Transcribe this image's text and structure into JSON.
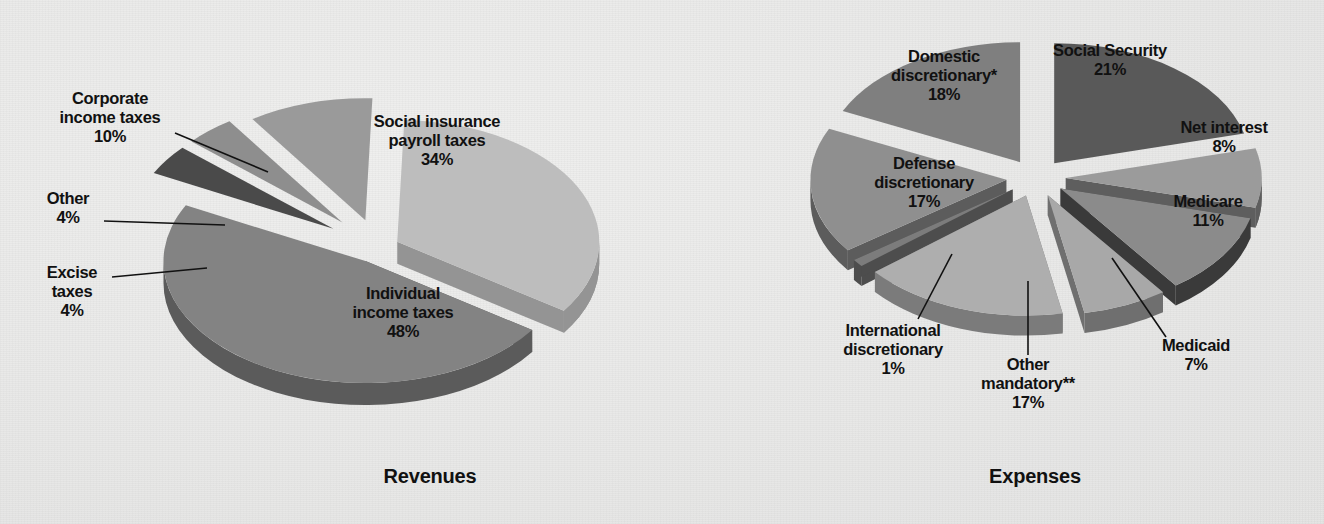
{
  "background_color": "#ececeb",
  "charts": [
    {
      "id": "revenues",
      "title": "Revenues",
      "type": "pie",
      "title_x": 430,
      "title_y": 483,
      "center": {
        "x": 378,
        "y": 248
      },
      "rx": 202,
      "ry": 122,
      "depth": 22,
      "slices": [
        {
          "name": "social-insurance-payroll-taxes",
          "label": "Social insurance\npayroll taxes",
          "value": 34,
          "value_label": "34%",
          "color": "#bdbdbd",
          "side_color": "#949494",
          "start": -88,
          "end": 34.4,
          "explode": 16,
          "explode_angle": -27,
          "label_pos": {
            "x": 437,
            "y": 127
          },
          "label_inside": true,
          "leader": null
        },
        {
          "name": "individual-income-taxes",
          "label": "Individual\nincome taxes",
          "value": 48,
          "value_label": "48%",
          "color": "#838383",
          "side_color": "#5b5b5b",
          "start": 34.4,
          "end": 207.2,
          "explode": 18,
          "explode_angle": 121,
          "label_pos": {
            "x": 403,
            "y": 299
          },
          "label_inside": true,
          "leader": null
        },
        {
          "name": "excise-taxes",
          "label": "Excise\ntaxes",
          "value": 4,
          "value_label": "4%",
          "color": "#4a4a4a",
          "side_color": "#1b1b1b",
          "start": 207.2,
          "end": 221.6,
          "explode": 40,
          "explode_angle": 214.4,
          "label_pos": {
            "x": 72,
            "y": 278
          },
          "label_inside": false,
          "leader": {
            "x1": 112,
            "y1": 277,
            "x2": 207,
            "y2": 268
          }
        },
        {
          "name": "other",
          "label": "Other",
          "value": 4,
          "value_label": "4%",
          "color": "#8e8e8e",
          "side_color": "#616161",
          "start": 221.6,
          "end": 236.0,
          "explode": 40,
          "explode_angle": 228.8,
          "label_pos": {
            "x": 68,
            "y": 204
          },
          "label_inside": false,
          "leader": {
            "x1": 104,
            "y1": 221,
            "x2": 225,
            "y2": 225
          }
        },
        {
          "name": "corporate-income-taxes",
          "label": "Corporate\nincome taxes",
          "value": 10,
          "value_label": "10%",
          "color": "#9a9a9a",
          "side_color": "#6d6d6d",
          "start": 236.0,
          "end": 272.0,
          "explode": 34,
          "explode_angle": 254,
          "label_pos": {
            "x": 110,
            "y": 104
          },
          "label_inside": false,
          "leader": {
            "x1": 175,
            "y1": 133,
            "x2": 268,
            "y2": 172
          }
        }
      ]
    },
    {
      "id": "expenses",
      "title": "Expenses",
      "type": "pie",
      "title_x": 1035,
      "title_y": 483,
      "center": {
        "x": 1036,
        "y": 178
      },
      "rx": 196,
      "ry": 120,
      "depth": 20,
      "slices": [
        {
          "name": "social-security",
          "label": "Social Security",
          "value": 21,
          "value_label": "21%",
          "color": "#595959",
          "side_color": "#121212",
          "start": -90,
          "end": -14.4,
          "explode": 22,
          "explode_angle": -52.2,
          "label_pos": {
            "x": 1110,
            "y": 56
          },
          "label_inside": true,
          "leader": null
        },
        {
          "name": "net-interest",
          "label": "Net interest",
          "value": 8,
          "value_label": "8%",
          "color": "#9b9b9b",
          "side_color": "#5e5e5e",
          "start": -14.4,
          "end": 14.4,
          "explode": 22,
          "explode_angle": 0,
          "label_pos": {
            "x": 1224,
            "y": 133
          },
          "label_inside": true,
          "leader": null
        },
        {
          "name": "medicare",
          "label": "Medicare",
          "value": 11,
          "value_label": "11%",
          "color": "#8b8b8b",
          "side_color": "#3a3a3a",
          "start": 14.4,
          "end": 54.0,
          "explode": 22,
          "explode_angle": 34.2,
          "label_pos": {
            "x": 1208,
            "y": 207
          },
          "label_inside": true,
          "leader": null
        },
        {
          "name": "medicaid",
          "label": "Medicaid",
          "value": 7,
          "value_label": "7%",
          "color": "#a8a8a8",
          "side_color": "#6f6f6f",
          "start": 54.0,
          "end": 79.2,
          "explode": 22,
          "explode_angle": 66.6,
          "label_pos": {
            "x": 1196,
            "y": 351
          },
          "label_inside": false,
          "leader": {
            "x1": 1166,
            "y1": 337,
            "x2": 1112,
            "y2": 258
          }
        },
        {
          "name": "other-mandatory",
          "label": "Other\nmandatory**",
          "value": 17,
          "value_label": "17%",
          "color": "#aeaeae",
          "side_color": "#7b7b7b",
          "start": 79.2,
          "end": 140.4,
          "explode": 22,
          "explode_angle": 109.8,
          "label_pos": {
            "x": 1028,
            "y": 370
          },
          "label_inside": false,
          "leader": {
            "x1": 1028,
            "y1": 355,
            "x2": 1028,
            "y2": 281
          }
        },
        {
          "name": "international-discretionary",
          "label": "International\ndiscretionary",
          "value": 1,
          "value_label": "1%",
          "color": "#7c7c7c",
          "side_color": "#4d4d4d",
          "start": 140.4,
          "end": 144.0,
          "explode": 22,
          "explode_angle": 142.2,
          "label_pos": {
            "x": 893,
            "y": 336
          },
          "label_inside": false,
          "leader": {
            "x1": 918,
            "y1": 319,
            "x2": 952,
            "y2": 254
          }
        },
        {
          "name": "defense-discretionary",
          "label": "Defense\ndiscretionary",
          "value": 17,
          "value_label": "17%",
          "color": "#8f8f8f",
          "side_color": "#5c5c5c",
          "start": 144.0,
          "end": 205.2,
          "explode": 22,
          "explode_angle": 174.6,
          "label_pos": {
            "x": 924,
            "y": 169
          },
          "label_inside": true,
          "leader": null
        },
        {
          "name": "domestic-discretionary",
          "label": "Domestic\ndiscretionary*",
          "value": 18,
          "value_label": "18%",
          "color": "#7f7f7f",
          "side_color": "#2e2e2e",
          "start": 205.2,
          "end": 270.0,
          "explode": 22,
          "explode_angle": 237.6,
          "label_pos": {
            "x": 944,
            "y": 62
          },
          "label_inside": true,
          "leader": null
        }
      ]
    }
  ],
  "chart_data": {
    "type": "pie",
    "charts": [
      {
        "title": "Revenues",
        "labels": [
          "Individual income taxes",
          "Social insurance payroll taxes",
          "Corporate income taxes",
          "Excise taxes",
          "Other"
        ],
        "values": [
          48,
          34,
          10,
          4,
          4
        ],
        "unit": "percent"
      },
      {
        "title": "Expenses",
        "labels": [
          "Social Security",
          "Domestic discretionary*",
          "Defense discretionary",
          "Other mandatory**",
          "Medicare",
          "Net interest",
          "Medicaid",
          "International discretionary"
        ],
        "values": [
          21,
          18,
          17,
          17,
          11,
          8,
          7,
          1
        ],
        "unit": "percent"
      }
    ],
    "legend": "none",
    "grid": false
  }
}
